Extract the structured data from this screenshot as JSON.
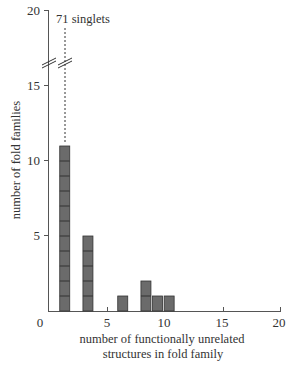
{
  "chart_data": {
    "type": "bar",
    "title": "",
    "xlabel": "number of functionally unrelated structures in fold family",
    "xlabel_lines": [
      "number of functionally unrelated",
      "structures in fold family"
    ],
    "ylabel": "number of fold families",
    "xlim": [
      0,
      20
    ],
    "ylim": [
      0,
      20
    ],
    "x_ticks": [
      0,
      5,
      10,
      15,
      20
    ],
    "y_ticks": [
      5,
      10,
      15,
      20
    ],
    "grid": false,
    "legend": null,
    "axis_break": {
      "axis": "y",
      "between": [
        11,
        17
      ]
    },
    "annotations": [
      {
        "text": "71 singlets",
        "x": 1.4,
        "note": "dashed line above bar at x=1 indicating 71 singlets (broken axis)"
      }
    ],
    "categories": [
      1,
      3,
      6,
      8,
      9,
      10
    ],
    "x": [
      1.4,
      3.4,
      6.4,
      8.4,
      9.4,
      10.4
    ],
    "values": [
      11,
      5,
      1,
      2,
      1,
      1
    ],
    "bar_color": "#6b6b6b",
    "bar_segment_color": "#333333"
  },
  "labels": {
    "annotation": "71 singlets",
    "ylabel": "number of fold families",
    "xlabel_line1": "number of functionally unrelated",
    "xlabel_line2": "structures in fold family",
    "x0": "0",
    "x5": "5",
    "x10": "10",
    "x15": "15",
    "x20": "20",
    "y5": "5",
    "y10": "10",
    "y15": "15",
    "y20": "20"
  }
}
